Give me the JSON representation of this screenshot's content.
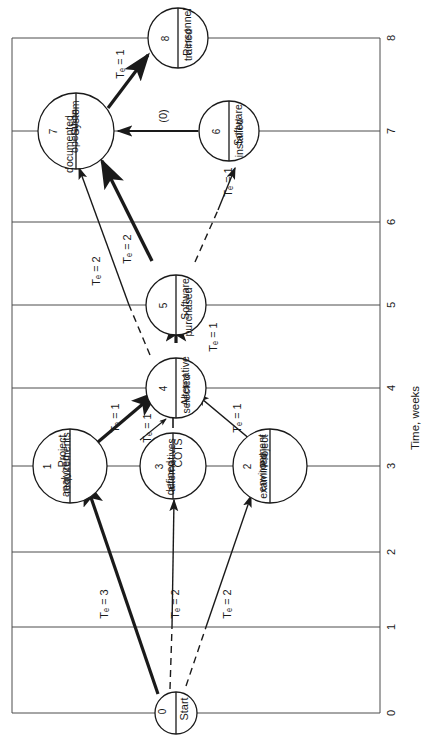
{
  "figure": {
    "type": "pert-network-time-scaled",
    "orientation_note": "diagram drawn rotated 90 degrees (text reads bottom-to-top)",
    "axis": {
      "label": "Time, weeks",
      "ticks": [
        "0",
        "1",
        "2",
        "3",
        "4",
        "5",
        "6",
        "7",
        "8"
      ],
      "min": 0,
      "max": 8
    },
    "nodes": [
      {
        "id": "0",
        "number": "0",
        "title_lines": [
          "Start"
        ],
        "time": 0.25
      },
      {
        "id": "1",
        "number": "1",
        "title_lines": [
          "Project",
          "requirements",
          "analyzed"
        ],
        "time": 3
      },
      {
        "id": "2",
        "number": "2",
        "title_lines": [
          "Project",
          "environment",
          "examined"
        ],
        "time": 3
      },
      {
        "id": "3",
        "number": "3",
        "title_lines": [
          "COTS",
          "alternatives",
          "defined"
        ],
        "time": 3
      },
      {
        "id": "4",
        "number": "4",
        "title_lines": [
          "Alternative",
          "selected"
        ],
        "time": 4
      },
      {
        "id": "5",
        "number": "5",
        "title_lines": [
          "Software",
          "purchased"
        ],
        "time": 5
      },
      {
        "id": "6",
        "number": "6",
        "title_lines": [
          "Software",
          "installed"
        ],
        "time": 7
      },
      {
        "id": "7",
        "number": "7",
        "title_lines": [
          "System",
          "operation",
          "documented"
        ],
        "time": 7
      },
      {
        "id": "8",
        "number": "8",
        "title_lines": [
          "Personnel",
          "trained"
        ],
        "time": 8
      }
    ],
    "edges": [
      {
        "from": "0",
        "to": "1",
        "label": "Tₑ = 3",
        "value": 3,
        "style": "critical"
      },
      {
        "from": "0",
        "to": "3",
        "label": "Tₑ = 2",
        "value": 2,
        "style": "dashed-solid"
      },
      {
        "from": "0",
        "to": "2",
        "label": "Tₑ = 2",
        "value": 2,
        "style": "dashed-solid"
      },
      {
        "from": "1",
        "to": "4",
        "label": "Tₑ = 1",
        "value": 1,
        "style": "critical"
      },
      {
        "from": "3",
        "to": "4",
        "label": "Tₑ = 1",
        "value": 1,
        "style": "solid"
      },
      {
        "from": "2",
        "to": "4",
        "label": "Tₑ = 1",
        "value": 1,
        "style": "solid"
      },
      {
        "from": "4",
        "to": "5",
        "label": "Tₑ = 1",
        "value": 1,
        "style": "critical"
      },
      {
        "from": "5",
        "to": "7",
        "label": "Tₑ = 2",
        "value": 2,
        "style": "critical"
      },
      {
        "from": "4",
        "to": "7",
        "label": "Tₑ = 2",
        "value": 2,
        "style": "solid"
      },
      {
        "from": "5",
        "to": "6",
        "label": "Tₑ = 1",
        "value": 1,
        "style": "dashed-solid"
      },
      {
        "from": "6",
        "to": "7",
        "label": "(0)",
        "value": 0,
        "style": "dummy"
      },
      {
        "from": "7",
        "to": "8",
        "label": "Tₑ = 1",
        "value": 1,
        "style": "critical"
      }
    ],
    "labels": {
      "te_3": "Tₑ = 3",
      "te_2": "Tₑ = 2",
      "te_1": "Tₑ = 1",
      "dummy_zero": "(0)"
    },
    "colors": {
      "line": "#1a1a1a",
      "grid": "#555555",
      "background": "#ffffff"
    }
  }
}
